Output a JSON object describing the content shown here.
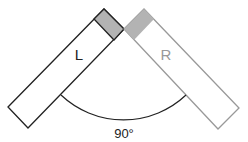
{
  "diagram": {
    "left_label": "L",
    "right_label": "R",
    "angle_label": "90°",
    "colors": {
      "left_stroke": "#222222",
      "right_stroke": "#999999",
      "block_fill": "#b3b3b3",
      "left_label": "#222222",
      "right_label": "#999999",
      "arc": "#222222"
    }
  }
}
